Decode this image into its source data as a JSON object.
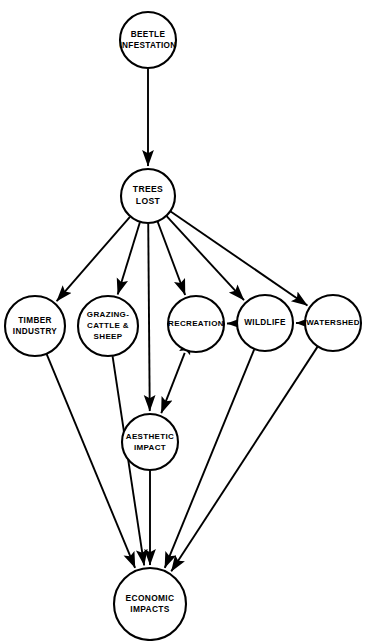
{
  "diagram": {
    "type": "directed-causal-graph",
    "width": 374,
    "height": 641,
    "background_color": "#ffffff",
    "line_color": "#000000",
    "node_fill_color": "#ffffff"
  },
  "nodes": [
    {
      "id": "beetle-infestation",
      "lines": [
        "BEETLE",
        "INFESTATION"
      ],
      "cx": 148,
      "cy": 40,
      "r": 28,
      "font_size": 8.2
    },
    {
      "id": "trees-lost",
      "lines": [
        "TREES",
        "LOST"
      ],
      "cx": 148,
      "cy": 196,
      "r": 27,
      "font_size": 8.6
    },
    {
      "id": "timber-industry",
      "lines": [
        "TIMBER",
        "INDUSTRY"
      ],
      "cx": 35,
      "cy": 326,
      "r": 30,
      "font_size": 8.2
    },
    {
      "id": "grazing-cattle-sheep",
      "lines": [
        "GRAZING-",
        "CATTLE &",
        "SHEEP"
      ],
      "cx": 108,
      "cy": 326,
      "r": 30,
      "font_size": 8.0
    },
    {
      "id": "recreation",
      "lines": [
        "RECREATION"
      ],
      "cx": 196,
      "cy": 324,
      "r": 28,
      "font_size": 8.0
    },
    {
      "id": "wildlife",
      "lines": [
        "WILDLIFE"
      ],
      "cx": 265,
      "cy": 323,
      "r": 28,
      "font_size": 8.2
    },
    {
      "id": "watershed",
      "lines": [
        "WATERSHED"
      ],
      "cx": 333,
      "cy": 323,
      "r": 28,
      "font_size": 8.0
    },
    {
      "id": "aesthetic-impact",
      "lines": [
        "AESTHETIC",
        "IMPACT"
      ],
      "cx": 150,
      "cy": 442,
      "r": 28,
      "font_size": 8.0
    },
    {
      "id": "economic-impacts",
      "lines": [
        "ECONOMIC",
        "IMPACTS"
      ],
      "cx": 150,
      "cy": 604,
      "r": 36,
      "font_size": 8.4
    }
  ],
  "edges": [
    {
      "id": "beetle-to-trees",
      "from": "beetle-infestation",
      "to": "trees-lost",
      "arrow": "end"
    },
    {
      "id": "trees-to-timber",
      "from": "trees-lost",
      "to": "timber-industry",
      "arrow": "end"
    },
    {
      "id": "trees-to-grazing",
      "from": "trees-lost",
      "to": "grazing-cattle-sheep",
      "arrow": "end"
    },
    {
      "id": "trees-to-aesthetic",
      "from": "trees-lost",
      "to": "aesthetic-impact",
      "arrow": "end"
    },
    {
      "id": "trees-to-recreation",
      "from": "trees-lost",
      "to": "recreation",
      "arrow": "end"
    },
    {
      "id": "trees-to-wildlife",
      "from": "trees-lost",
      "to": "wildlife",
      "arrow": "end"
    },
    {
      "id": "trees-to-watershed",
      "from": "trees-lost",
      "to": "watershed",
      "arrow": "end"
    },
    {
      "id": "watershed-to-wildlife",
      "from": "watershed",
      "to": "wildlife",
      "arrow": "end"
    },
    {
      "id": "wildlife-to-recreation",
      "from": "wildlife",
      "to": "recreation",
      "arrow": "end"
    },
    {
      "id": "recreation-aesthetic",
      "from": "recreation",
      "to": "aesthetic-impact",
      "arrow": "both"
    },
    {
      "id": "timber-to-economic",
      "from": "timber-industry",
      "to": "economic-impacts",
      "arrow": "end"
    },
    {
      "id": "grazing-to-economic",
      "from": "grazing-cattle-sheep",
      "to": "economic-impacts",
      "arrow": "end"
    },
    {
      "id": "aesthetic-to-economic",
      "from": "aesthetic-impact",
      "to": "economic-impacts",
      "arrow": "end"
    },
    {
      "id": "wildlife-to-economic",
      "from": "wildlife",
      "to": "economic-impacts",
      "arrow": "end"
    },
    {
      "id": "watershed-to-economic",
      "from": "watershed",
      "to": "economic-impacts",
      "arrow": "end"
    }
  ]
}
